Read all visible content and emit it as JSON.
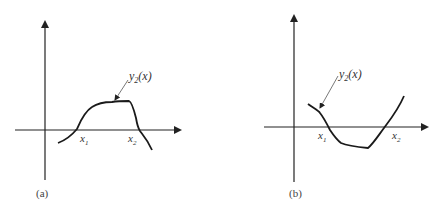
{
  "panels": [
    {
      "id": "a",
      "caption": "(a)",
      "curve_label": "y2(x)",
      "curve_label_main": "y",
      "curve_label_sub": "2",
      "curve_label_arg": "(x)",
      "root1_label": "x",
      "root1_sub": "1",
      "root2_label": "x",
      "root2_sub": "2"
    },
    {
      "id": "b",
      "caption": "(b)",
      "curve_label": "y2(x)",
      "curve_label_main": "y",
      "curve_label_sub": "2",
      "curve_label_arg": "(x)",
      "root1_label": "x",
      "root1_sub": "1",
      "root2_label": "x",
      "root2_sub": "2"
    }
  ],
  "colors": {
    "axis": "#222222",
    "curve": "#1a1a1a",
    "leader": "#555555",
    "background": "#ffffff"
  }
}
